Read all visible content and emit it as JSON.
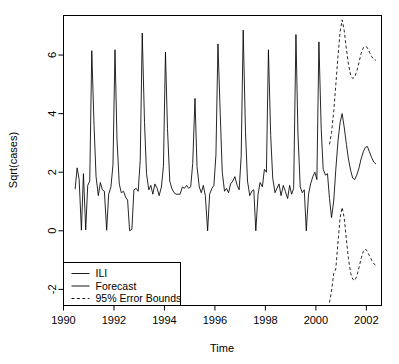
{
  "chart_data": {
    "type": "line",
    "title": "",
    "xlabel": "Time",
    "ylabel": "Sqrt(cases)",
    "xlim": [
      1990.0,
      2002.6
    ],
    "ylim": [
      -2.55,
      7.35
    ],
    "xticks": [
      1990,
      1992,
      1994,
      1996,
      1998,
      2000,
      2002
    ],
    "yticks": [
      -2,
      0,
      2,
      4,
      6
    ],
    "grid": false,
    "legend_position": "bottom-left",
    "legend": [
      {
        "label": "ILI",
        "style": "solid"
      },
      {
        "label": "Forecast",
        "style": "solid"
      },
      {
        "label": "95% Error Bounds",
        "style": "dashed"
      }
    ],
    "series": [
      {
        "name": "ILI",
        "style": "solid",
        "x": [
          1990.46,
          1990.54,
          1990.62,
          1990.71,
          1990.79,
          1990.88,
          1990.96,
          1991.04,
          1991.12,
          1991.21,
          1991.29,
          1991.38,
          1991.46,
          1991.54,
          1991.62,
          1991.71,
          1991.79,
          1991.88,
          1991.96,
          1992.04,
          1992.12,
          1992.21,
          1992.29,
          1992.38,
          1992.46,
          1992.54,
          1992.62,
          1992.71,
          1992.79,
          1992.88,
          1992.96,
          1993.04,
          1993.12,
          1993.21,
          1993.29,
          1993.38,
          1993.46,
          1993.54,
          1993.62,
          1993.71,
          1993.79,
          1993.88,
          1993.96,
          1994.04,
          1994.12,
          1994.21,
          1994.29,
          1994.38,
          1994.46,
          1994.54,
          1994.62,
          1994.71,
          1994.79,
          1994.88,
          1994.96,
          1995.04,
          1995.12,
          1995.21,
          1995.29,
          1995.38,
          1995.46,
          1995.54,
          1995.62,
          1995.71,
          1995.79,
          1995.88,
          1995.96,
          1996.04,
          1996.12,
          1996.21,
          1996.29,
          1996.38,
          1996.46,
          1996.54,
          1996.62,
          1996.71,
          1996.79,
          1996.88,
          1996.96,
          1997.04,
          1997.12,
          1997.21,
          1997.29,
          1997.38,
          1997.46,
          1997.54,
          1997.62,
          1997.71,
          1997.79,
          1997.88,
          1997.96,
          1998.04,
          1998.12,
          1998.21,
          1998.29,
          1998.38,
          1998.46,
          1998.54,
          1998.62,
          1998.71,
          1998.79,
          1998.88,
          1998.96,
          1999.04,
          1999.12,
          1999.21,
          1999.29,
          1999.38,
          1999.46,
          1999.54,
          1999.62,
          1999.71,
          1999.79,
          1999.88,
          1999.96,
          2000.04,
          2000.12,
          2000.21,
          2000.29,
          2000.38,
          2000.46
        ],
        "y": [
          1.42,
          2.15,
          1.75,
          0.02,
          1.95,
          0.03,
          1.55,
          1.7,
          6.15,
          3.6,
          1.85,
          1.2,
          1.65,
          1.4,
          1.35,
          0.02,
          1.25,
          1.5,
          2.25,
          6.18,
          3.1,
          1.6,
          1.3,
          1.35,
          1.15,
          1.05,
          0.0,
          0.05,
          1.4,
          1.45,
          1.35,
          2.4,
          6.75,
          3.7,
          1.95,
          1.4,
          1.55,
          1.25,
          1.6,
          1.45,
          1.2,
          1.5,
          2.2,
          6.1,
          3.5,
          1.7,
          1.45,
          1.3,
          1.25,
          1.25,
          1.25,
          1.5,
          1.45,
          1.55,
          1.45,
          1.5,
          2.3,
          4.52,
          2.2,
          1.5,
          1.3,
          1.55,
          1.2,
          0.0,
          1.25,
          1.45,
          1.55,
          2.6,
          6.38,
          4.0,
          2.0,
          1.35,
          1.45,
          1.3,
          1.6,
          1.7,
          1.85,
          1.55,
          1.4,
          2.55,
          6.85,
          3.4,
          1.7,
          1.2,
          1.35,
          1.4,
          0.0,
          1.25,
          1.65,
          1.5,
          2.1,
          2.0,
          6.18,
          3.25,
          1.8,
          1.3,
          1.45,
          1.6,
          1.2,
          1.55,
          1.35,
          1.1,
          1.55,
          1.25,
          1.45,
          6.7,
          3.3,
          1.5,
          1.3,
          1.4,
          0.0,
          1.25,
          1.6,
          1.85,
          2.0,
          1.75,
          6.45,
          3.5,
          2.1,
          1.9,
          1.95
        ]
      },
      {
        "name": "Forecast",
        "style": "solid",
        "x": [
          2000.46,
          2000.54,
          2000.62,
          2000.71,
          2000.79,
          2000.88,
          2000.96,
          2001.04,
          2001.12,
          2001.21,
          2001.29,
          2001.38,
          2001.46,
          2001.54,
          2001.62,
          2001.71,
          2001.79,
          2001.88,
          2001.96,
          2002.04,
          2002.12,
          2002.21,
          2002.29,
          2002.38
        ],
        "y": [
          1.95,
          1.1,
          0.45,
          1.05,
          2.1,
          3.1,
          3.7,
          4.0,
          3.55,
          2.95,
          2.45,
          2.05,
          1.8,
          1.75,
          1.9,
          2.15,
          2.45,
          2.7,
          2.85,
          2.88,
          2.7,
          2.5,
          2.35,
          2.28
        ]
      },
      {
        "name": "95% Error Bounds Upper",
        "style": "dashed",
        "x": [
          2000.54,
          2000.62,
          2000.71,
          2000.79,
          2000.88,
          2000.96,
          2001.04,
          2001.12,
          2001.21,
          2001.29,
          2001.38,
          2001.46,
          2001.54,
          2001.62,
          2001.71,
          2001.79,
          2001.88,
          2001.96,
          2002.04,
          2002.12,
          2002.21,
          2002.29,
          2002.38
        ],
        "y": [
          2.95,
          3.35,
          4.1,
          5.0,
          6.0,
          6.8,
          7.2,
          6.85,
          6.2,
          5.7,
          5.3,
          5.2,
          5.25,
          5.45,
          5.75,
          6.05,
          6.25,
          6.3,
          6.25,
          6.1,
          5.95,
          5.85,
          5.82
        ]
      },
      {
        "name": "95% Error Bounds Lower",
        "style": "dashed",
        "x": [
          2000.54,
          2000.62,
          2000.71,
          2000.79,
          2000.88,
          2000.96,
          2001.04,
          2001.12,
          2001.21,
          2001.29,
          2001.38,
          2001.46,
          2001.54,
          2001.62,
          2001.71,
          2001.79,
          2001.88,
          2001.96,
          2002.04,
          2002.12,
          2002.21,
          2002.29,
          2002.38
        ],
        "y": [
          -2.45,
          -2.05,
          -1.45,
          -1.3,
          -0.35,
          0.45,
          0.8,
          0.45,
          -0.3,
          -0.95,
          -1.45,
          -1.65,
          -1.7,
          -1.55,
          -1.25,
          -0.95,
          -0.7,
          -0.62,
          -0.7,
          -0.85,
          -1.0,
          -1.12,
          -1.18
        ]
      }
    ]
  }
}
